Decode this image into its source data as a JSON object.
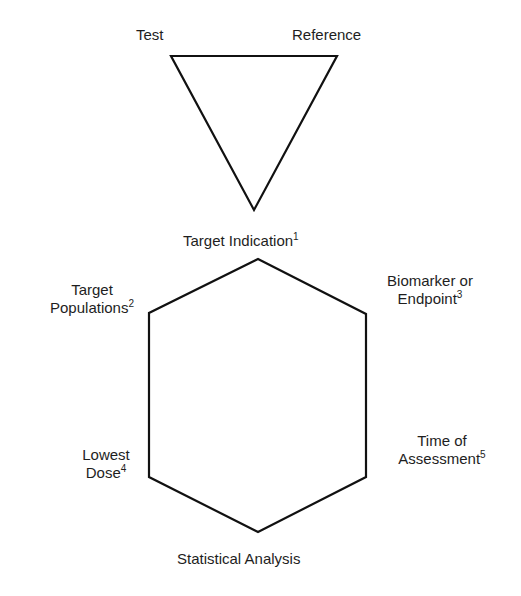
{
  "diagram": {
    "triangle": {
      "stroke": "#111111",
      "stroke_width": 2.2,
      "points": [
        [
          171,
          56
        ],
        [
          337,
          56
        ],
        [
          254,
          210
        ]
      ],
      "labels": {
        "top_left": "Test",
        "top_right": "Reference"
      }
    },
    "hexagon": {
      "stroke": "#111111",
      "stroke_width": 2.2,
      "points": [
        [
          258,
          259
        ],
        [
          366,
          314
        ],
        [
          366,
          477
        ],
        [
          258,
          532
        ],
        [
          149,
          477
        ],
        [
          149,
          313
        ]
      ],
      "labels": {
        "top": {
          "text": "Target Indication",
          "sup": "1"
        },
        "upper_left": {
          "line1": "Target",
          "line2": "Populations",
          "sup": "2"
        },
        "upper_right": {
          "line1": "Biomarker or",
          "line2": "Endpoint",
          "sup": "3"
        },
        "lower_left": {
          "line1": "Lowest",
          "line2": "Dose",
          "sup": "4"
        },
        "lower_right": {
          "line1": "Time of",
          "line2": "Assessment",
          "sup": "5"
        },
        "bottom": {
          "text": "Statistical Analysis"
        }
      }
    }
  }
}
